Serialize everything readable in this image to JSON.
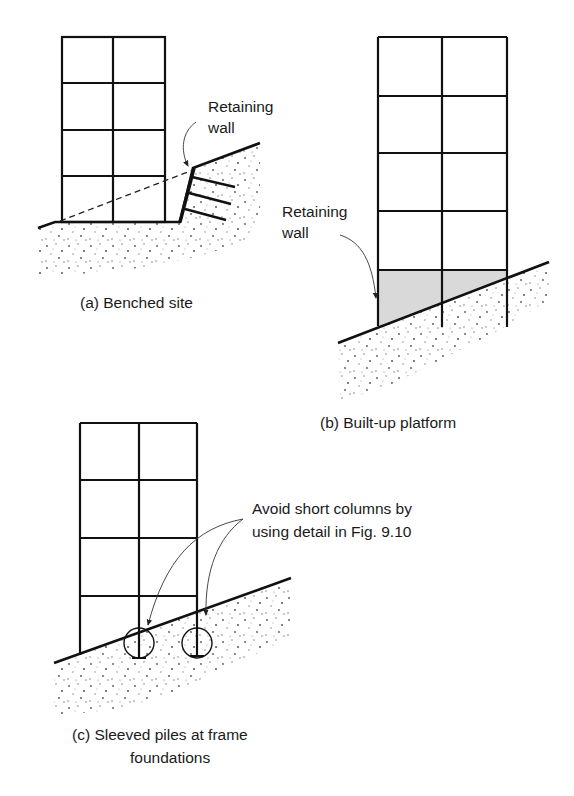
{
  "figure": {
    "panels": [
      {
        "id": "a",
        "caption": "(a) Benched site",
        "labels": {
          "retaining_wall_line1": "Retaining",
          "retaining_wall_line2": "wall"
        }
      },
      {
        "id": "b",
        "caption": "(b) Built-up platform",
        "labels": {
          "retaining_wall_line1": "Retaining",
          "retaining_wall_line2": "wall"
        }
      },
      {
        "id": "c",
        "caption_line1": "(c) Sleeved piles at frame",
        "caption_line2": "foundations",
        "labels": {
          "note_line1": "Avoid short columns by",
          "note_line2": "using detail in Fig. 9.10"
        }
      }
    ],
    "colors": {
      "line": "#111111",
      "soil_dots": "#555555",
      "platform_fill": "#d9d9d9"
    }
  }
}
